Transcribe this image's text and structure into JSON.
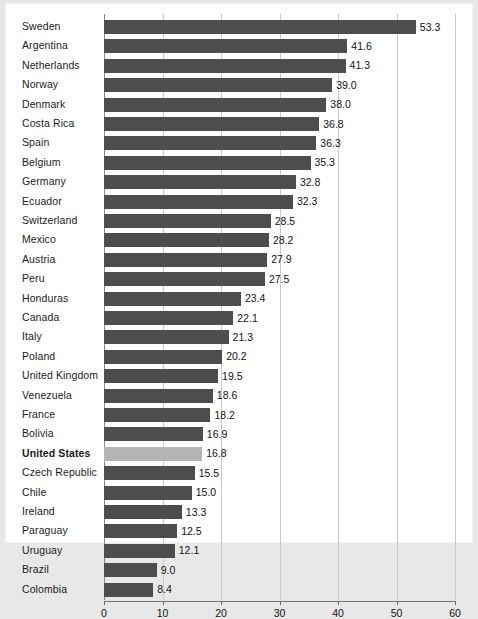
{
  "chart_data": {
    "type": "bar",
    "orientation": "horizontal",
    "title": "",
    "subtitle": "",
    "xlabel": "",
    "ylabel": "",
    "xlim": [
      0,
      60
    ],
    "xticks": [
      "0",
      "10",
      "20",
      "30",
      "40",
      "50",
      "60"
    ],
    "grid": true,
    "legend": "none",
    "highlight_category": "United States",
    "colors": {
      "bar": "#4d4d4d",
      "bar_highlight": "#b4b4b4",
      "background": "#ffffff",
      "page_background": "#e8e8e8",
      "gridline": "#c9c9c9",
      "axis": "#6f6f6f",
      "text": "#121212"
    },
    "categories": [
      "Sweden",
      "Argentina",
      "Netherlands",
      "Norway",
      "Denmark",
      "Costa Rica",
      "Spain",
      "Belgium",
      "Germany",
      "Ecuador",
      "Switzerland",
      "Mexico",
      "Austria",
      "Peru",
      "Honduras",
      "Canada",
      "Italy",
      "Poland",
      "United Kingdom",
      "Venezuela",
      "France",
      "Bolivia",
      "United States",
      "Czech Republic",
      "Chile",
      "Ireland",
      "Paraguay",
      "Uruguay",
      "Brazil",
      "Colombia"
    ],
    "values": [
      53.3,
      41.6,
      41.3,
      39.0,
      38.0,
      36.8,
      36.3,
      35.3,
      32.8,
      32.3,
      28.5,
      28.2,
      27.9,
      27.5,
      23.4,
      22.1,
      21.3,
      20.2,
      19.5,
      18.6,
      18.2,
      16.9,
      16.8,
      15.5,
      15.0,
      13.3,
      12.5,
      12.1,
      9.0,
      8.4
    ],
    "value_labels": [
      "53.3",
      "41.6",
      "41.3",
      "39.0",
      "38.0",
      "36.8",
      "36.3",
      "35.3",
      "32.8",
      "32.3",
      "28.5",
      "28.2",
      "27.9",
      "27.5",
      "23.4",
      "22.1",
      "21.3",
      "20.2",
      "19.5",
      "18.6",
      "18.2",
      "16.9",
      "16.8",
      "15.5",
      "15.0",
      "13.3",
      "12.5",
      "12.1",
      "9.0",
      "8.4"
    ]
  }
}
